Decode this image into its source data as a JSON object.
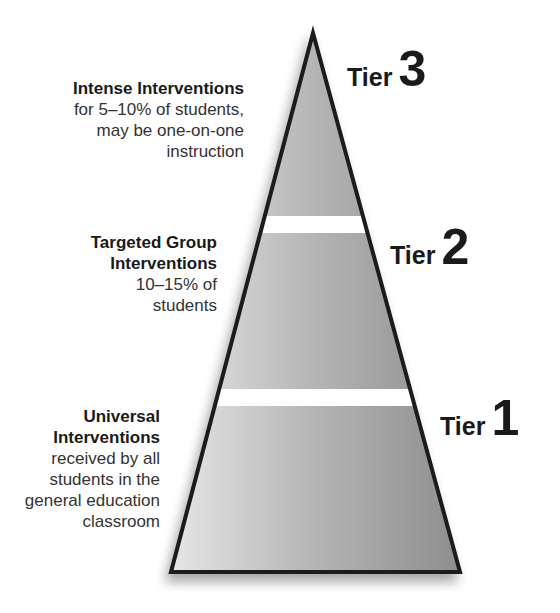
{
  "diagram": {
    "type": "pyramid",
    "colors": {
      "fill": "#a8a8a8",
      "fill_light": "#d8d8d8",
      "outline": "#1a1a1a",
      "gap": "#ffffff"
    }
  },
  "tiers": [
    {
      "tier_word": "Tier",
      "tier_number": "3",
      "heading": "Intense Interventions",
      "body_lines": [
        "for 5–10% of students,",
        "may be one-on-one",
        "instruction"
      ]
    },
    {
      "tier_word": "Tier",
      "tier_number": "2",
      "heading_lines": [
        "Targeted Group",
        "Interventions"
      ],
      "body_lines": [
        "10–15% of",
        "students"
      ]
    },
    {
      "tier_word": "Tier",
      "tier_number": "1",
      "heading_lines": [
        "Universal",
        "Interventions"
      ],
      "body_lines": [
        "received by all",
        "students in the",
        "general education",
        "classroom"
      ]
    }
  ]
}
